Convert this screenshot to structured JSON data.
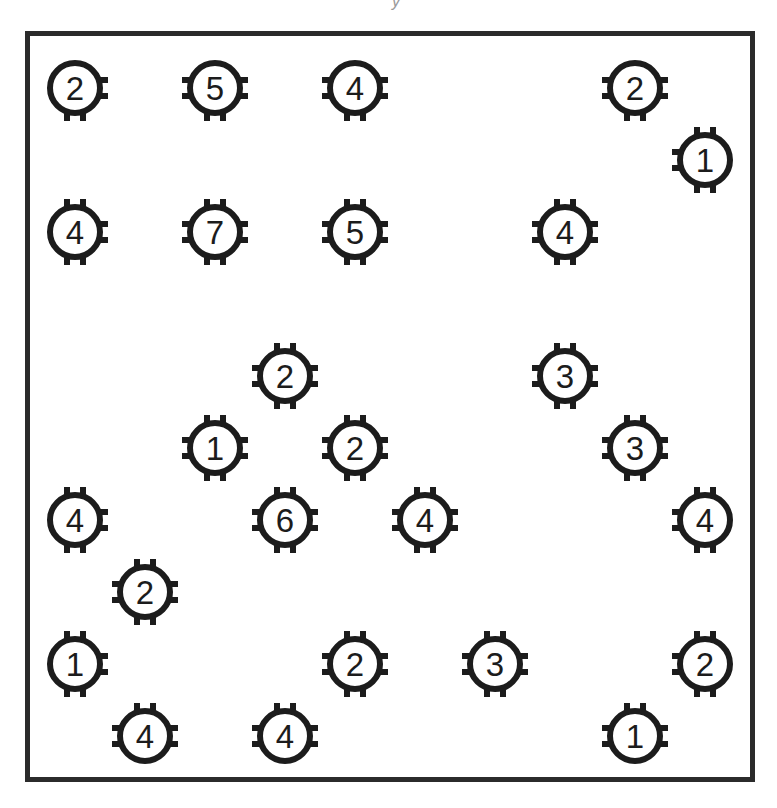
{
  "title_fragment": "y",
  "board": {
    "border_color": "#2b2b2b",
    "island_color": "#1c1c1c",
    "origin": {
      "x": 25,
      "y": 31
    },
    "columns_x": [
      75,
      145,
      215,
      285,
      355,
      425,
      495,
      565,
      635,
      705
    ],
    "rows_y": [
      88,
      160,
      232,
      304,
      376,
      448,
      520,
      592,
      664,
      736
    ]
  },
  "islands": [
    {
      "value": "2",
      "col": 0,
      "row": 0,
      "stubs": [
        "right",
        "bottom"
      ]
    },
    {
      "value": "5",
      "col": 2,
      "row": 0,
      "stubs": [
        "left",
        "right",
        "bottom"
      ]
    },
    {
      "value": "4",
      "col": 4,
      "row": 0,
      "stubs": [
        "left",
        "right",
        "bottom"
      ]
    },
    {
      "value": "2",
      "col": 8,
      "row": 0,
      "stubs": [
        "left",
        "right",
        "bottom"
      ]
    },
    {
      "value": "1",
      "col": 9,
      "row": 1,
      "stubs": [
        "top",
        "left",
        "bottom"
      ]
    },
    {
      "value": "4",
      "col": 0,
      "row": 2,
      "stubs": [
        "top",
        "right",
        "bottom"
      ]
    },
    {
      "value": "7",
      "col": 2,
      "row": 2,
      "stubs": [
        "top",
        "left",
        "right",
        "bottom"
      ]
    },
    {
      "value": "5",
      "col": 4,
      "row": 2,
      "stubs": [
        "top",
        "left",
        "right",
        "bottom"
      ]
    },
    {
      "value": "4",
      "col": 7,
      "row": 2,
      "stubs": [
        "top",
        "left",
        "right",
        "bottom"
      ]
    },
    {
      "value": "2",
      "col": 3,
      "row": 4,
      "stubs": [
        "top",
        "left",
        "right",
        "bottom"
      ]
    },
    {
      "value": "3",
      "col": 7,
      "row": 4,
      "stubs": [
        "top",
        "left",
        "right",
        "bottom"
      ]
    },
    {
      "value": "1",
      "col": 2,
      "row": 5,
      "stubs": [
        "top",
        "left",
        "right",
        "bottom"
      ]
    },
    {
      "value": "2",
      "col": 4,
      "row": 5,
      "stubs": [
        "top",
        "left",
        "right",
        "bottom"
      ]
    },
    {
      "value": "3",
      "col": 8,
      "row": 5,
      "stubs": [
        "top",
        "left",
        "right",
        "bottom"
      ]
    },
    {
      "value": "4",
      "col": 0,
      "row": 6,
      "stubs": [
        "top",
        "right",
        "bottom"
      ]
    },
    {
      "value": "6",
      "col": 3,
      "row": 6,
      "stubs": [
        "top",
        "left",
        "right",
        "bottom"
      ]
    },
    {
      "value": "4",
      "col": 5,
      "row": 6,
      "stubs": [
        "top",
        "left",
        "right",
        "bottom"
      ]
    },
    {
      "value": "4",
      "col": 9,
      "row": 6,
      "stubs": [
        "top",
        "left",
        "bottom"
      ]
    },
    {
      "value": "2",
      "col": 1,
      "row": 7,
      "stubs": [
        "top",
        "left",
        "right",
        "bottom"
      ]
    },
    {
      "value": "1",
      "col": 0,
      "row": 8,
      "stubs": [
        "top",
        "right",
        "bottom"
      ]
    },
    {
      "value": "2",
      "col": 4,
      "row": 8,
      "stubs": [
        "top",
        "left",
        "right",
        "bottom"
      ]
    },
    {
      "value": "3",
      "col": 6,
      "row": 8,
      "stubs": [
        "top",
        "left",
        "right",
        "bottom"
      ]
    },
    {
      "value": "2",
      "col": 9,
      "row": 8,
      "stubs": [
        "top",
        "left",
        "bottom"
      ]
    },
    {
      "value": "4",
      "col": 1,
      "row": 9,
      "stubs": [
        "top",
        "left",
        "right"
      ]
    },
    {
      "value": "4",
      "col": 3,
      "row": 9,
      "stubs": [
        "top",
        "left",
        "right"
      ]
    },
    {
      "value": "1",
      "col": 8,
      "row": 9,
      "stubs": [
        "top",
        "left",
        "right"
      ]
    }
  ]
}
